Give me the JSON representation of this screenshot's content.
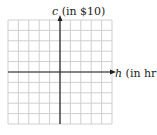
{
  "figure": {
    "y_axis_label_var": "c",
    "y_axis_label_unit": " (in $10)",
    "x_axis_label_var": "h",
    "x_axis_label_unit": " (in hr)"
  },
  "grid": {
    "columns": 10,
    "rows": 10,
    "left": 8,
    "top": 20,
    "cell": 10.4,
    "origin_col": 5,
    "origin_row": 5,
    "grid_color": "#cfcfcf",
    "axis_color": "#222222"
  }
}
